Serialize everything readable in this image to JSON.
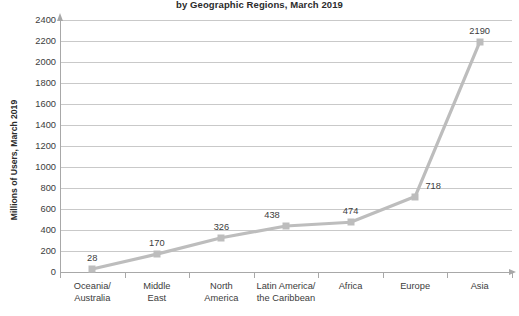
{
  "chart_data": {
    "type": "line",
    "title": "by Geographic Regions, March 2019",
    "xlabel": "",
    "ylabel": "Millions of Users, March 2019",
    "categories": [
      "Oceania/ Australia",
      "Middle East",
      "North America",
      "Latin America/ the Caribbean",
      "Africa",
      "Europe",
      "Asia"
    ],
    "category_lines": [
      [
        "Oceania/",
        "Australia"
      ],
      [
        "Middle",
        "East"
      ],
      [
        "North",
        "America"
      ],
      [
        "Latin America/",
        "the Caribbean"
      ],
      [
        "Africa",
        ""
      ],
      [
        "Europe",
        ""
      ],
      [
        "Asia",
        ""
      ]
    ],
    "values": [
      28,
      170,
      326,
      438,
      474,
      718,
      2190
    ],
    "data_labels": [
      "28",
      "170",
      "326",
      "438",
      "474",
      "718",
      "2190"
    ],
    "ylim": [
      0,
      2400
    ],
    "ytick_step": 200,
    "yticks": [
      2400,
      2200,
      2000,
      1800,
      1600,
      1400,
      1200,
      1000,
      800,
      600,
      400,
      200,
      0
    ],
    "ytick_labels": [
      "2400",
      "2200",
      "2000",
      "1800",
      "1600",
      "1400",
      "1200",
      "1000",
      "800",
      "600",
      "400",
      "200",
      "0"
    ],
    "grid": true,
    "legend": false,
    "series_color": "#bdbdbd",
    "gridline_color": "#c9c9c9",
    "axis_color": "#a8a8a8",
    "text_color": "#3c3c3c",
    "background_color": "#ffffff"
  }
}
